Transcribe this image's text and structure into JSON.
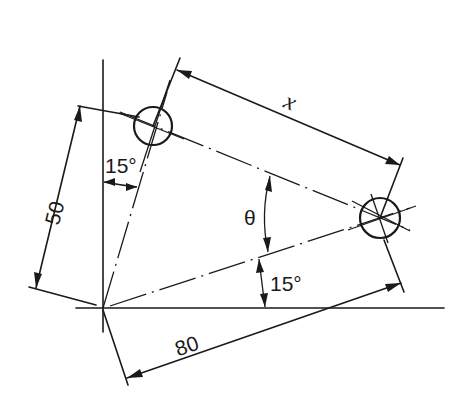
{
  "diagram": {
    "type": "engineering-dimension-drawing",
    "labels": {
      "dim_x": "x",
      "dim_50": "50",
      "dim_80": "80",
      "angle_theta": "θ",
      "angle_top": "15°",
      "angle_bottom": "15°"
    },
    "colors": {
      "ink": "#1a1a1a",
      "background": "#ffffff"
    }
  }
}
